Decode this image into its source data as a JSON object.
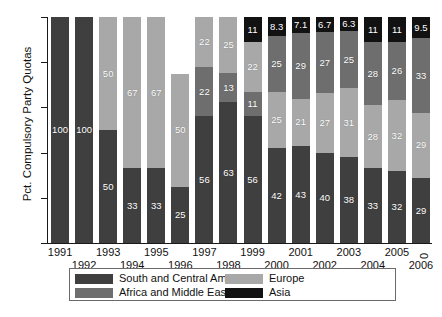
{
  "chart_data": {
    "type": "bar",
    "stacked": true,
    "stack_mode": "percent",
    "title": "",
    "xlabel": "",
    "ylabel": "Pct. Compulsory Party Quotas",
    "ylim": [
      0,
      100
    ],
    "yticks": [
      0,
      20,
      40,
      60,
      80,
      100
    ],
    "grid": false,
    "legend_position": "bottom",
    "categories": [
      "1991",
      "1992",
      "1993",
      "1994",
      "1995",
      "1996",
      "1997",
      "1998",
      "1999",
      "2000",
      "2001",
      "2002",
      "2003",
      "2004",
      "2005",
      "2006"
    ],
    "series": [
      {
        "name": "South and Central America",
        "color": "#3f3f3f",
        "values": [
          100,
          100,
          50,
          33,
          33,
          25,
          56,
          63,
          56,
          42,
          43,
          40,
          38,
          33,
          32,
          29
        ],
        "labels": [
          "100",
          "100",
          "50",
          "33",
          "33",
          "25",
          "56",
          "63",
          "56",
          "42",
          "43",
          "40",
          "38",
          "33",
          "32",
          "29"
        ]
      },
      {
        "name": "Africa and Middle East",
        "color": "#6e6e6e",
        "values": [
          0,
          0,
          0,
          0,
          0,
          0,
          22,
          13,
          11,
          25,
          29,
          27,
          25,
          28,
          26,
          33
        ],
        "labels": [
          "",
          "",
          "",
          "",
          "",
          "",
          "22",
          "13",
          "11",
          "25",
          "29",
          "27",
          "25",
          "28",
          "26",
          "33"
        ]
      },
      {
        "name": "Europe",
        "color": "#a8a8a8",
        "values": [
          0,
          0,
          50,
          67,
          67,
          50,
          22,
          25,
          22,
          25,
          21,
          27,
          31,
          28,
          32,
          29
        ],
        "labels": [
          "",
          "",
          "50",
          "67",
          "67",
          "50",
          "22",
          "25",
          "22",
          "25",
          "21",
          "27",
          "31",
          "28",
          "32",
          "29"
        ]
      },
      {
        "name": "Asia",
        "color": "#121212",
        "values": [
          0,
          0,
          0,
          0,
          0,
          25,
          0,
          0,
          11,
          8.3,
          7.1,
          6.7,
          6.3,
          11,
          11,
          9.5
        ],
        "labels": [
          "",
          "",
          "",
          "",
          "",
          "25",
          "",
          "",
          "11",
          "8.3",
          "7.1",
          "6.7",
          "6.3",
          "11",
          "11",
          "9.5"
        ]
      }
    ],
    "stack_order_per_category": [
      [
        "sca"
      ],
      [
        "sca"
      ],
      [
        "sca",
        "eur"
      ],
      [
        "sca",
        "eur"
      ],
      [
        "sca",
        "eur"
      ],
      [
        "sca",
        "eur",
        "afr"
      ],
      [
        "sca",
        "afr",
        "eur"
      ],
      [
        "sca",
        "afr",
        "eur"
      ],
      [
        "sca",
        "afr",
        "eur",
        "asi"
      ],
      [
        "sca",
        "eur",
        "afr",
        "asi"
      ],
      [
        "sca",
        "eur",
        "afr",
        "asi"
      ],
      [
        "sca",
        "eur",
        "afr",
        "asi"
      ],
      [
        "sca",
        "eur",
        "afr",
        "asi"
      ],
      [
        "sca",
        "eur",
        "afr",
        "asi"
      ],
      [
        "sca",
        "eur",
        "afr",
        "asi"
      ],
      [
        "sca",
        "eur",
        "afr",
        "asi"
      ]
    ]
  },
  "axis": {
    "y_title": "Pct. Compulsory Party Quotas",
    "y_ticks": [
      "0",
      "20",
      "40",
      "60",
      "80",
      "100"
    ],
    "x_ticks": [
      "1991",
      "1992",
      "1993",
      "1994",
      "1995",
      "1996",
      "1997",
      "1998",
      "1999",
      "2000",
      "2001",
      "2002",
      "2003",
      "2004",
      "2005",
      "2006"
    ]
  },
  "legend": {
    "items": [
      {
        "label": "South and Central America",
        "key": "sca",
        "color": "#3f3f3f"
      },
      {
        "label": "Europe",
        "key": "eur",
        "color": "#a8a8a8"
      },
      {
        "label": "Africa and Middle East",
        "key": "afr",
        "color": "#6e6e6e"
      },
      {
        "label": "Asia",
        "key": "asi",
        "color": "#121212"
      }
    ]
  }
}
